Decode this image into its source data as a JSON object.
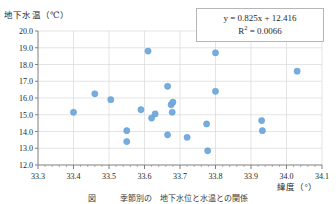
{
  "figure": {
    "caption": "図　　　季節別の　地下水位と水温との関係",
    "marker_color": "#6fa8dc",
    "marker_edge_color": "#5b9bd5",
    "trendline_color": "#9dc3e6",
    "grid_color": "#d9d9d9",
    "axis_color": "#7f7f7f"
  },
  "annotation": {
    "equation": "y = 0.825x + 12.416",
    "r_squared_prefix": "R",
    "r_squared_exponent": "2",
    "r_squared_value": " = 0.0066"
  },
  "chart_data": {
    "type": "scatter",
    "title": "",
    "xlabel": "緯度（°）",
    "ylabel": "地下水温（℃）",
    "xlim": [
      33.3,
      34.1
    ],
    "ylim": [
      12.0,
      20.0
    ],
    "xticks": [
      "33.3",
      "33.4",
      "33.5",
      "33.6",
      "33.7",
      "33.8",
      "33.9",
      "34.0",
      "34.1"
    ],
    "yticks": [
      "12.0",
      "13.0",
      "14.0",
      "15.0",
      "16.0",
      "17.0",
      "18.0",
      "19.0",
      "20.0"
    ],
    "xtick_values": [
      33.3,
      33.4,
      33.5,
      33.6,
      33.7,
      33.8,
      33.9,
      34.0,
      34.1
    ],
    "ytick_values": [
      12.0,
      13.0,
      14.0,
      15.0,
      16.0,
      17.0,
      18.0,
      19.0,
      20.0
    ],
    "grid": true,
    "legend": false,
    "series": [
      {
        "name": "地下水温",
        "points": [
          {
            "x": 33.4,
            "y": 15.15
          },
          {
            "x": 33.46,
            "y": 16.25
          },
          {
            "x": 33.505,
            "y": 15.9
          },
          {
            "x": 33.55,
            "y": 14.05
          },
          {
            "x": 33.55,
            "y": 13.4
          },
          {
            "x": 33.59,
            "y": 15.3
          },
          {
            "x": 33.61,
            "y": 18.8
          },
          {
            "x": 33.62,
            "y": 14.8
          },
          {
            "x": 33.63,
            "y": 15.05
          },
          {
            "x": 33.665,
            "y": 13.8
          },
          {
            "x": 33.665,
            "y": 16.7
          },
          {
            "x": 33.675,
            "y": 15.6
          },
          {
            "x": 33.68,
            "y": 15.75
          },
          {
            "x": 33.678,
            "y": 15.15
          },
          {
            "x": 33.72,
            "y": 13.65
          },
          {
            "x": 33.775,
            "y": 14.45
          },
          {
            "x": 33.778,
            "y": 12.85
          },
          {
            "x": 33.8,
            "y": 18.7
          },
          {
            "x": 33.8,
            "y": 16.4
          },
          {
            "x": 33.93,
            "y": 14.65
          },
          {
            "x": 33.932,
            "y": 14.05
          },
          {
            "x": 34.03,
            "y": 17.6
          }
        ]
      }
    ],
    "trendline": {
      "slope": 0.825,
      "intercept": 12.416,
      "r_squared": 0.0066,
      "style": "dotted",
      "x_start": 33.39,
      "x_end": 34.04
    }
  }
}
